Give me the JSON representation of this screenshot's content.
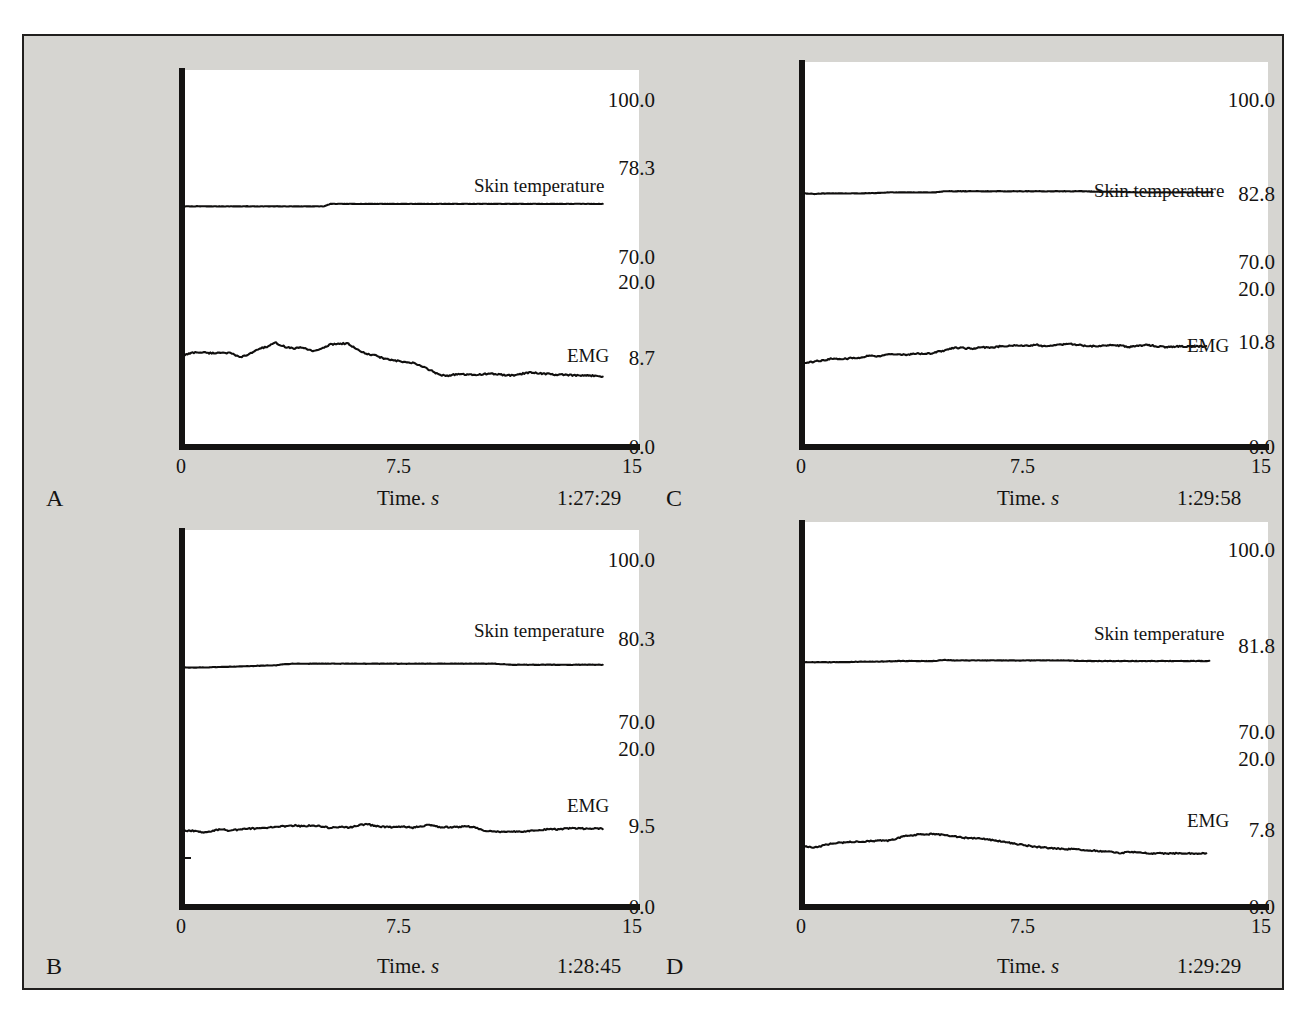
{
  "figure": {
    "background_color": "#d6d5d1",
    "frame_color": "#211f1e",
    "trace_color": "#100f0e",
    "axis_title": "Time.",
    "axis_title_italic": "s",
    "series_names": {
      "temperature": "Skin temperature",
      "emg": "EMG"
    },
    "x_ticks": [
      "0",
      "7.5",
      "15"
    ]
  },
  "chart_data": [
    {
      "id": "A",
      "type": "line",
      "panel_letter": "A",
      "timestamp": "1:27:29",
      "xlabel": "Time. s",
      "ylabel": "",
      "xlim": [
        0,
        15
      ],
      "x_ticks": [
        0,
        7.5,
        15
      ],
      "x_tick_labels": [
        "0",
        "7.5",
        "15"
      ],
      "y_tick_labels": [
        "100.0",
        "78.3",
        "70.0",
        "20.0",
        "8.7",
        "0.0"
      ],
      "y_tick_values": [
        100.0,
        78.3,
        70.0,
        20.0,
        8.7,
        0.0
      ],
      "grid": false,
      "legend": "inline-annotation",
      "series": [
        {
          "name": "Skin temperature",
          "axis": "upper",
          "ylim": [
            70.0,
            100.0
          ],
          "baseline": 78.3,
          "x": [
            0.0,
            0.6,
            1.2,
            1.8,
            2.4,
            3.0,
            3.6,
            4.2,
            4.6,
            4.8,
            5.4,
            6.0,
            6.6,
            7.2,
            7.8,
            8.4,
            9.0,
            9.6,
            10.2,
            10.8,
            11.4,
            12.0,
            12.6,
            13.2,
            13.8
          ],
          "values": [
            78.3,
            78.3,
            78.3,
            78.3,
            78.3,
            78.3,
            78.3,
            78.3,
            78.3,
            78.8,
            78.8,
            78.8,
            78.8,
            78.8,
            78.8,
            78.8,
            78.8,
            78.8,
            78.8,
            78.8,
            78.8,
            78.8,
            78.8,
            78.8,
            78.8
          ]
        },
        {
          "name": "EMG",
          "axis": "lower",
          "ylim": [
            0.0,
            20.0
          ],
          "baseline": 8.7,
          "x": [
            0.0,
            0.3,
            0.6,
            0.9,
            1.2,
            1.5,
            1.8,
            2.1,
            2.4,
            2.7,
            3.0,
            3.3,
            3.6,
            3.9,
            4.2,
            4.5,
            4.8,
            5.1,
            5.4,
            5.7,
            6.0,
            6.3,
            6.6,
            6.9,
            7.2,
            7.5,
            7.8,
            8.1,
            8.4,
            8.7,
            9.0,
            9.3,
            9.6,
            9.9,
            10.2,
            10.5,
            10.8,
            11.1,
            11.4,
            11.7,
            12.0,
            12.3,
            12.6,
            12.9,
            13.2,
            13.5,
            13.8
          ],
          "values": [
            10.9,
            11.2,
            11.2,
            11.1,
            11.2,
            11.1,
            10.6,
            10.9,
            11.6,
            11.9,
            12.4,
            11.9,
            11.7,
            11.8,
            11.4,
            11.6,
            12.2,
            12.3,
            12.3,
            11.5,
            11.0,
            10.8,
            10.4,
            10.2,
            10.0,
            9.9,
            9.5,
            9.0,
            8.4,
            8.3,
            8.5,
            8.4,
            8.4,
            8.5,
            8.5,
            8.4,
            8.3,
            8.5,
            8.7,
            8.6,
            8.5,
            8.4,
            8.4,
            8.3,
            8.3,
            8.3,
            8.2
          ]
        }
      ]
    },
    {
      "id": "B",
      "type": "line",
      "panel_letter": "B",
      "timestamp": "1:28:45",
      "xlabel": "Time. s",
      "ylabel": "",
      "xlim": [
        0,
        15
      ],
      "x_ticks": [
        0,
        7.5,
        15
      ],
      "x_tick_labels": [
        "0",
        "7.5",
        "15"
      ],
      "y_tick_labels": [
        "100.0",
        "80.3",
        "70.0",
        "20.0",
        "9.5",
        "0.0"
      ],
      "y_tick_values": [
        100.0,
        80.3,
        70.0,
        20.0,
        9.5,
        0.0
      ],
      "grid": false,
      "legend": "inline-annotation",
      "series": [
        {
          "name": "Skin temperature",
          "axis": "upper",
          "ylim": [
            70.0,
            100.0
          ],
          "baseline": 80.3,
          "x": [
            0.0,
            0.6,
            1.2,
            1.8,
            2.4,
            3.0,
            3.3,
            3.6,
            4.2,
            4.8,
            5.4,
            6.0,
            6.6,
            7.2,
            7.8,
            8.4,
            9.0,
            9.6,
            10.2,
            10.5,
            10.8,
            11.4,
            12.0,
            12.6,
            13.2,
            13.8
          ],
          "values": [
            80.1,
            80.1,
            80.2,
            80.3,
            80.4,
            80.5,
            80.7,
            80.8,
            80.8,
            80.8,
            80.8,
            80.8,
            80.8,
            80.8,
            80.8,
            80.8,
            80.8,
            80.8,
            80.8,
            80.7,
            80.6,
            80.6,
            80.6,
            80.6,
            80.6,
            80.6
          ]
        },
        {
          "name": "EMG",
          "axis": "lower",
          "ylim": [
            0.0,
            20.0
          ],
          "baseline": 9.5,
          "x": [
            0.0,
            0.3,
            0.6,
            0.9,
            1.2,
            1.5,
            1.8,
            2.1,
            2.4,
            2.7,
            3.0,
            3.3,
            3.6,
            3.9,
            4.2,
            4.5,
            4.8,
            5.1,
            5.4,
            5.7,
            6.0,
            6.3,
            6.6,
            6.9,
            7.2,
            7.5,
            7.8,
            8.1,
            8.4,
            8.7,
            9.0,
            9.3,
            9.6,
            9.9,
            10.2,
            10.5,
            10.8,
            11.1,
            11.4,
            11.7,
            12.0,
            12.3,
            12.6,
            12.9,
            13.2,
            13.5,
            13.8
          ],
          "values": [
            9.3,
            9.3,
            9.1,
            9.3,
            9.5,
            9.3,
            9.5,
            9.6,
            9.6,
            9.7,
            9.9,
            9.9,
            10.0,
            9.9,
            10.0,
            9.9,
            9.7,
            9.8,
            9.7,
            10.0,
            10.2,
            9.9,
            9.8,
            9.8,
            9.9,
            9.7,
            9.9,
            10.1,
            9.8,
            9.8,
            9.8,
            9.9,
            9.7,
            9.3,
            9.2,
            9.2,
            9.2,
            9.2,
            9.3,
            9.4,
            9.5,
            9.5,
            9.6,
            9.6,
            9.6,
            9.6,
            9.6
          ]
        }
      ]
    },
    {
      "id": "C",
      "type": "line",
      "panel_letter": "C",
      "timestamp": "1:29:58",
      "xlabel": "Time. s",
      "ylabel": "",
      "xlim": [
        0,
        15
      ],
      "x_ticks": [
        0,
        7.5,
        15
      ],
      "x_tick_labels": [
        "0",
        "7.5",
        "15"
      ],
      "y_tick_labels": [
        "100.0",
        "82.8",
        "70.0",
        "20.0",
        "10.8",
        "0.0"
      ],
      "y_tick_values": [
        100.0,
        82.8,
        70.0,
        20.0,
        10.8,
        0.0
      ],
      "grid": false,
      "legend": "inline-annotation",
      "series": [
        {
          "name": "Skin temperature",
          "axis": "upper",
          "ylim": [
            70.0,
            100.0
          ],
          "baseline": 82.8,
          "x": [
            0.0,
            0.3,
            0.6,
            1.2,
            1.8,
            2.4,
            2.7,
            3.0,
            3.6,
            4.2,
            4.5,
            4.8,
            5.4,
            6.0,
            6.6,
            7.2,
            7.8,
            8.4,
            9.0,
            9.6,
            10.2,
            10.8,
            11.4,
            12.0,
            12.6,
            13.2
          ],
          "values": [
            82.7,
            82.6,
            82.7,
            82.7,
            82.7,
            82.8,
            82.9,
            82.9,
            82.9,
            82.9,
            83.1,
            83.1,
            83.1,
            83.1,
            83.1,
            83.1,
            83.1,
            83.1,
            83.1,
            83.0,
            83.0,
            82.9,
            82.9,
            82.9,
            82.9,
            82.9
          ]
        },
        {
          "name": "EMG",
          "axis": "lower",
          "ylim": [
            0.0,
            20.0
          ],
          "baseline": 10.8,
          "x": [
            0.0,
            0.3,
            0.6,
            0.9,
            1.2,
            1.5,
            1.8,
            2.1,
            2.4,
            2.7,
            3.0,
            3.3,
            3.6,
            3.9,
            4.2,
            4.5,
            4.8,
            5.1,
            5.4,
            5.7,
            6.0,
            6.3,
            6.6,
            6.9,
            7.2,
            7.5,
            7.8,
            8.1,
            8.4,
            8.7,
            9.0,
            9.3,
            9.6,
            9.9,
            10.2,
            10.5,
            10.8,
            11.1,
            11.4,
            11.7,
            12.0,
            12.3,
            12.6,
            13.0
          ],
          "values": [
            10.4,
            10.5,
            10.7,
            10.9,
            10.8,
            11.0,
            11.0,
            11.3,
            11.2,
            11.5,
            11.5,
            11.4,
            11.6,
            11.5,
            11.7,
            11.9,
            12.3,
            12.3,
            12.2,
            12.4,
            12.3,
            12.5,
            12.6,
            12.6,
            12.6,
            12.7,
            12.5,
            12.6,
            12.8,
            12.8,
            12.6,
            12.5,
            12.6,
            12.7,
            12.6,
            12.4,
            12.6,
            12.7,
            12.5,
            12.4,
            12.5,
            12.5,
            12.5,
            12.5
          ]
        }
      ]
    },
    {
      "id": "D",
      "type": "line",
      "panel_letter": "D",
      "timestamp": "1:29:29",
      "xlabel": "Time. s",
      "ylabel": "",
      "xlim": [
        0,
        15
      ],
      "x_ticks": [
        0,
        7.5,
        15
      ],
      "x_tick_labels": [
        "0",
        "7.5",
        "15"
      ],
      "y_tick_labels": [
        "100.0",
        "81.8",
        "70.0",
        "20.0",
        "7.8",
        "0.0"
      ],
      "y_tick_values": [
        100.0,
        81.8,
        70.0,
        20.0,
        7.8,
        0.0
      ],
      "grid": false,
      "legend": "inline-annotation",
      "series": [
        {
          "name": "Skin temperature",
          "axis": "upper",
          "ylim": [
            70.0,
            100.0
          ],
          "baseline": 81.8,
          "x": [
            0.0,
            0.6,
            1.2,
            1.8,
            2.4,
            3.0,
            3.6,
            4.2,
            4.5,
            4.8,
            5.1,
            5.4,
            6.0,
            6.6,
            7.2,
            7.8,
            8.4,
            9.0,
            9.6,
            10.2,
            10.8,
            11.4,
            12.0,
            12.6,
            13.1
          ],
          "values": [
            81.5,
            81.5,
            81.5,
            81.6,
            81.6,
            81.7,
            81.7,
            81.7,
            81.9,
            81.8,
            81.8,
            81.8,
            81.8,
            81.8,
            81.8,
            81.8,
            81.8,
            81.7,
            81.7,
            81.7,
            81.7,
            81.7,
            81.7,
            81.7,
            81.7
          ]
        },
        {
          "name": "EMG",
          "axis": "lower",
          "ylim": [
            0.0,
            20.0
          ],
          "baseline": 7.8,
          "x": [
            0.0,
            0.3,
            0.6,
            0.9,
            1.2,
            1.5,
            1.8,
            2.1,
            2.4,
            2.7,
            3.0,
            3.3,
            3.6,
            3.9,
            4.2,
            4.5,
            4.8,
            5.1,
            5.4,
            5.7,
            6.0,
            6.3,
            6.6,
            6.9,
            7.2,
            7.5,
            7.8,
            8.1,
            8.4,
            8.7,
            9.0,
            9.3,
            9.6,
            9.9,
            10.2,
            10.5,
            10.8,
            11.1,
            11.4,
            11.7,
            12.0,
            12.4,
            13.0
          ],
          "values": [
            7.8,
            7.6,
            7.9,
            8.2,
            8.3,
            8.4,
            8.4,
            8.5,
            8.6,
            8.6,
            8.9,
            9.3,
            9.4,
            9.5,
            9.5,
            9.4,
            9.2,
            9.0,
            8.9,
            8.9,
            8.7,
            8.5,
            8.3,
            8.1,
            7.9,
            7.7,
            7.6,
            7.5,
            7.4,
            7.4,
            7.3,
            7.2,
            7.1,
            7.0,
            6.8,
            7.0,
            6.9,
            6.8,
            6.8,
            6.8,
            6.8,
            6.8,
            6.8
          ]
        }
      ]
    }
  ]
}
